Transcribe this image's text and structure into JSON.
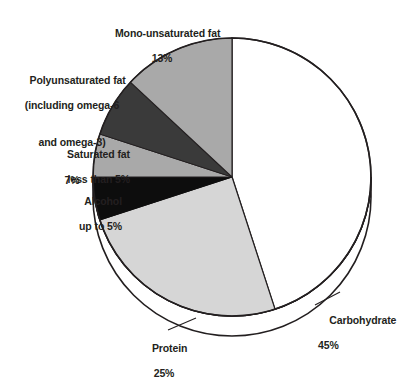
{
  "chart_data": {
    "type": "pie",
    "title": "",
    "subtitle": "",
    "xlabel": "",
    "ylabel": "",
    "legend_position": "none",
    "grid": false,
    "units": "percent of total energy intake",
    "start_angle_deg": 0,
    "direction": "clockwise",
    "total": 100,
    "categories": [
      "Carbohydrate",
      "Protein",
      "Alcohol",
      "Saturated fat",
      "Polyunsaturated fat (including omega-6 and omega-3)",
      "Mono-unsaturated fat"
    ],
    "values": [
      45,
      25,
      5,
      5,
      7,
      13
    ],
    "slices": [
      {
        "name": "carbohydrate",
        "label_lines": [
          "Carbohydrate"
        ],
        "value_text": "45%",
        "value": 45,
        "color": "#ffffff",
        "start_deg": 0,
        "end_deg": 162
      },
      {
        "name": "protein",
        "label_lines": [
          "Protein"
        ],
        "value_text": "25%",
        "value": 25,
        "color": "#d6d6d6",
        "start_deg": 162,
        "end_deg": 252
      },
      {
        "name": "alcohol",
        "label_lines": [
          "Alcohol"
        ],
        "value_text": "up to 5%",
        "value": 5,
        "color": "#0d0d0d",
        "start_deg": 252,
        "end_deg": 270
      },
      {
        "name": "saturated-fat",
        "label_lines": [
          "Saturated fat"
        ],
        "value_text": "less than 5%",
        "value": 5,
        "color": "#a9a9a9",
        "start_deg": 270,
        "end_deg": 288
      },
      {
        "name": "polyunsaturated-fat",
        "label_lines": [
          "Polyunsaturated fat",
          "(including omega-6",
          "and omega-3)"
        ],
        "value_text": "7%",
        "value": 7,
        "color": "#3a3a3a",
        "start_deg": 288,
        "end_deg": 313
      },
      {
        "name": "mono-unsaturated-fat",
        "label_lines": [
          "Mono-unsaturated fat"
        ],
        "value_text": "13%",
        "value": 13,
        "color": "#a9a9a9",
        "start_deg": 313,
        "end_deg": 360
      }
    ]
  },
  "labels": {
    "mono": {
      "line1": "Mono-unsaturated fat",
      "pct": "13%"
    },
    "poly": {
      "line1": "Polyunsaturated fat",
      "line2": "(including omega-6",
      "line3": "and omega-3)",
      "pct": "7%"
    },
    "saturated": {
      "line1": "Saturated fat",
      "pct": "less than 5%"
    },
    "alcohol": {
      "line1": "Alcohol",
      "pct": "up to 5%"
    },
    "carbohydrate": {
      "line1": "Carbohydrate",
      "pct": "45%"
    },
    "protein": {
      "line1": "Protein",
      "pct": "25%"
    }
  },
  "colors": {
    "outline": "#231f20",
    "text": "#231f20",
    "background": "#ffffff",
    "slice_white": "#ffffff",
    "slice_light_gray": "#d6d6d6",
    "slice_mid_gray": "#a9a9a9",
    "slice_dark_gray": "#3a3a3a",
    "slice_black": "#0d0d0d"
  }
}
